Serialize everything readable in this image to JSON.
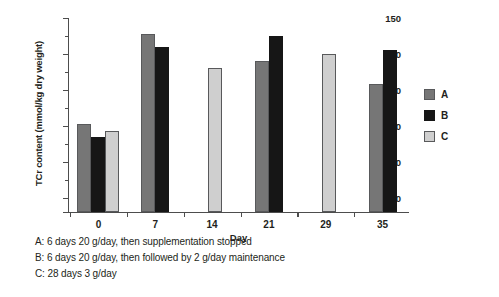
{
  "chart_data": {
    "type": "bar",
    "title": "",
    "xlabel": "Day",
    "ylabel": "TCr content (mmol/kg dry weight)",
    "categories": [
      "0",
      "7",
      "14",
      "21",
      "29",
      "35"
    ],
    "ylim": [
      96,
      150
    ],
    "yticks": [
      100,
      110,
      120,
      130,
      140,
      150
    ],
    "yticks_minor": [
      105,
      115,
      125,
      135,
      145
    ],
    "grid": false,
    "legend_position": "right",
    "series": [
      {
        "name": "A",
        "color": "#767676",
        "values": [
          120.5,
          145.5,
          null,
          138.0,
          null,
          131.5
        ]
      },
      {
        "name": "B",
        "color": "#161616",
        "values": [
          117.0,
          142.0,
          null,
          145.0,
          null,
          141.0
        ]
      },
      {
        "name": "C",
        "color": "#cfcfcf",
        "values": [
          118.5,
          null,
          136.0,
          null,
          140.0,
          null
        ]
      }
    ]
  },
  "legend": {
    "items": [
      {
        "label": "A",
        "series": "A"
      },
      {
        "label": "B",
        "series": "B"
      },
      {
        "label": "C",
        "series": "C"
      }
    ]
  },
  "axes": {
    "y_title": "TCr content (mmol/kg dry weight)",
    "x_title": "Day",
    "y_tick_labels": [
      "150",
      "140",
      "130",
      "120",
      "110",
      "100"
    ],
    "x_tick_labels": [
      "0",
      "7",
      "14",
      "21",
      "29",
      "35"
    ]
  },
  "caption": {
    "lines": [
      "A: 6 days 20 g/day, then supplementation stopped",
      "B: 6 days 20 g/day, then followed by 2 g/day maintenance",
      "C: 28 days 3 g/day"
    ]
  }
}
